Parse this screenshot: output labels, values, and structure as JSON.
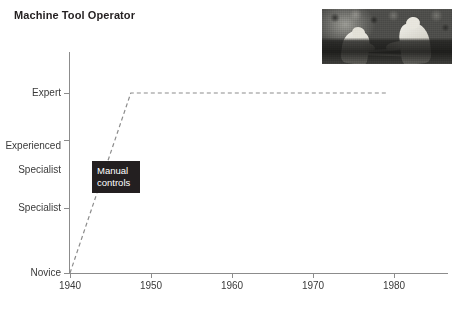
{
  "chart_data": {
    "type": "line",
    "title": "Machine Tool Operator",
    "xlabel": "",
    "ylabel": "",
    "xlim": [
      1940,
      1985
    ],
    "xticks": [
      1940,
      1950,
      1960,
      1970,
      1980
    ],
    "xtick_labels": [
      "1940",
      "1950",
      "1960",
      "1970",
      "1980"
    ],
    "ylim": [
      0,
      4
    ],
    "yticks": [
      0,
      2,
      3,
      4
    ],
    "ytick_labels": [
      "Novice",
      "Specialist",
      "Experienced\nSpecialist",
      "Expert"
    ],
    "grid": false,
    "legend": false,
    "line_style": "dashed",
    "line_color": "#8c8c8c",
    "series": [
      {
        "name": "Machine Tool Operator skill level",
        "points": [
          {
            "x": 1940,
            "y": 0,
            "y_label": "Novice"
          },
          {
            "x": 1947.5,
            "y": 4,
            "y_label": "Expert"
          },
          {
            "x": 1979,
            "y": 4,
            "y_label": "Expert"
          }
        ]
      }
    ],
    "annotations": [
      {
        "text_lines": [
          "Manual",
          "controls"
        ],
        "x": 1942.7,
        "y": 2.45,
        "background": "#231f20",
        "color": "#ffffff"
      }
    ],
    "images": [
      {
        "name": "machine-tool-operator-photo",
        "description": "Black and white photograph of two machine tool operators working at a machine",
        "x": 1979,
        "y": 4.6
      }
    ]
  },
  "figure": {
    "title": "Machine Tool Operator",
    "background": "#ffffff",
    "axis_color": "#8c8c8c",
    "text_color": "#3a3a3a",
    "title_color": "#231f20"
  },
  "axes": {
    "y_labels": [
      {
        "id": "expert",
        "text": "Expert"
      },
      {
        "id": "experienced-specialist",
        "line1": "Experienced",
        "line2": "Specialist"
      },
      {
        "id": "specialist",
        "text": "Specialist"
      },
      {
        "id": "novice",
        "text": "Novice"
      }
    ],
    "x_labels": [
      {
        "id": "1940",
        "text": "1940"
      },
      {
        "id": "1950",
        "text": "1950"
      },
      {
        "id": "1960",
        "text": "1960"
      },
      {
        "id": "1970",
        "text": "1970"
      },
      {
        "id": "1980",
        "text": "1980"
      }
    ]
  },
  "annotation": {
    "line1": "Manual",
    "line2": "controls"
  }
}
